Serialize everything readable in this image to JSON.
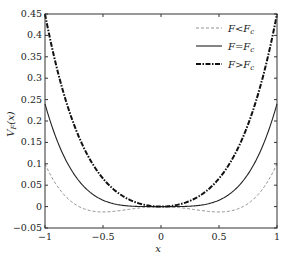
{
  "chart_data": {
    "type": "line",
    "title": "",
    "xlabel": "x",
    "ylabel": "V_F(x)",
    "xlim": [
      -1,
      1
    ],
    "ylim": [
      -0.05,
      0.45
    ],
    "x_ticks": [
      "-1",
      "-0.5",
      "0",
      "0.5",
      "1"
    ],
    "y_ticks": [
      "-0.05",
      "0",
      "0.05",
      "0.1",
      "0.15",
      "0.2",
      "0.25",
      "0.3",
      "0.35",
      "0.4",
      "0.45"
    ],
    "grid": false,
    "legend_position": "upper right",
    "series": [
      {
        "name": "F<F_c",
        "style": "dashed",
        "values_at": {
          "-1": 0.1,
          "-0.5": -0.02,
          "0": 0,
          "0.5": -0.02,
          "1": 0.1
        }
      },
      {
        "name": "F=F_c",
        "style": "solid",
        "values_at": {
          "-1": 0.24,
          "-0.5": 0.03,
          "0": 0,
          "0.5": 0.03,
          "1": 0.24
        }
      },
      {
        "name": "F>F_c",
        "style": "dash-dot-thick",
        "values_at": {
          "-1": 0.45,
          "-0.5": 0.09,
          "0": 0,
          "0.5": 0.09,
          "1": 0.45
        }
      }
    ]
  },
  "legend": {
    "items": [
      {
        "main": "F",
        "op": "<",
        "rhs": "F",
        "sub": "c"
      },
      {
        "main": "F",
        "op": "=",
        "rhs": "F",
        "sub": "c"
      },
      {
        "main": "F",
        "op": ">",
        "rhs": "F",
        "sub": "c"
      }
    ]
  },
  "axis": {
    "xlabel": "x",
    "ylabel_main": "V",
    "ylabel_sub": "F",
    "ylabel_arg": "(x)"
  }
}
